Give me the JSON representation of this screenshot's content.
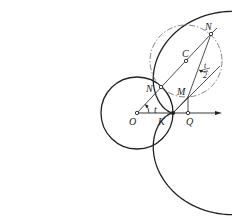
{
  "figure": {
    "stroke_color": "#222222",
    "background": "#ffffff"
  },
  "points": {
    "O": {
      "label": "O",
      "x": 137,
      "y": 113
    },
    "K": {
      "label": "K",
      "x": 173,
      "y": 113
    },
    "Q": {
      "label": "Q",
      "x": 188,
      "y": 113
    },
    "N_inner": {
      "label": "N",
      "x": 161,
      "y": 87
    },
    "C": {
      "label": "C",
      "x": 186,
      "y": 61
    },
    "N_outer": {
      "label": "N",
      "x": 211,
      "y": 34
    },
    "M": {
      "label": "M",
      "x": 188,
      "y": 97
    }
  },
  "angles": {
    "t": {
      "label": "t"
    },
    "half_t": {
      "numerator": "t",
      "denominator": "2"
    }
  },
  "circles": {
    "base": {
      "cx": 137,
      "cy": 113,
      "r": 36,
      "style": "solid"
    },
    "rolling": {
      "cx": 186,
      "cy": 61,
      "r": 36,
      "style": "dash-dot"
    }
  },
  "cardioid": {
    "cusp_x": 173,
    "cusp_y": 113,
    "a": 39.5,
    "scale_y": 0.99
  },
  "axis": {
    "from_x": 137,
    "to_x": 222,
    "y": 113
  }
}
